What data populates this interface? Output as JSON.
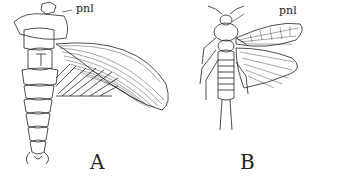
{
  "figure": {
    "panels": [
      {
        "id": "A",
        "label": "A",
        "annotation": "pnl",
        "subject": "insect-lateral-wing-spread"
      },
      {
        "id": "B",
        "label": "B",
        "annotation": "pnl",
        "subject": "insect-dorsal-view"
      }
    ],
    "colors": {
      "ink": "#222222",
      "background": "#ffffff"
    }
  }
}
